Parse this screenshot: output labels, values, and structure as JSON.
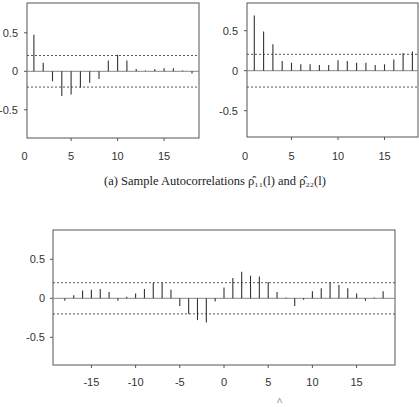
{
  "captions": {
    "a": {
      "prefix": "(a) Sample Autocorrelations ",
      "rho11": "ρ̂₁₁(l)",
      "middle": " and ",
      "rho22": "ρ̂₂₂(l)"
    },
    "b_partial": "^"
  },
  "style": {
    "bar_color": "#333333",
    "frame_color": "#555555",
    "zero_line_color": "#888888",
    "ci_line_color": "#444444"
  },
  "chart_data": [
    {
      "id": "acf11",
      "type": "bar",
      "title": "Sample Autocorrelation rho_11(l)",
      "xlabel": "",
      "ylabel": "",
      "x": [
        1,
        2,
        3,
        4,
        5,
        6,
        7,
        8,
        9,
        10,
        11,
        12,
        13,
        14,
        15,
        16,
        17,
        18
      ],
      "values": [
        0.475,
        0.11,
        -0.13,
        -0.32,
        -0.3,
        -0.21,
        -0.15,
        -0.1,
        0.14,
        0.215,
        0.14,
        0.03,
        0.01,
        0.03,
        0.04,
        0.04,
        0.01,
        -0.03
      ],
      "xticks": [
        0,
        5,
        10,
        15
      ],
      "xtick_labels": [
        "0",
        "5",
        "10",
        "15"
      ],
      "yticks": [
        0.5,
        0,
        -0.5
      ],
      "ytick_labels": [
        "0.5",
        "0",
        "-0.5"
      ],
      "ylim": [
        -0.85,
        0.88
      ],
      "xlim": [
        0.25,
        18.8
      ],
      "confidence_band": 0.205,
      "grid": false
    },
    {
      "id": "acf22",
      "type": "bar",
      "title": "Sample Autocorrelation rho_22(l)",
      "xlabel": "",
      "ylabel": "",
      "x": [
        1,
        2,
        3,
        4,
        5,
        6,
        7,
        8,
        9,
        10,
        11,
        12,
        13,
        14,
        15,
        16,
        17,
        18
      ],
      "values": [
        0.69,
        0.49,
        0.33,
        0.12,
        0.1,
        0.08,
        0.08,
        0.07,
        0.07,
        0.13,
        0.12,
        0.1,
        0.1,
        0.07,
        0.08,
        0.14,
        0.22,
        0.24
      ],
      "xticks": [
        0,
        5,
        10,
        15
      ],
      "xtick_labels": [
        "0",
        "5",
        "10",
        "15"
      ],
      "yticks": [
        0.5,
        0,
        -0.5
      ],
      "ytick_labels": [
        "0.5",
        "0",
        "-0.5"
      ],
      "ylim": [
        -0.85,
        0.88
      ],
      "xlim": [
        0.25,
        18.8
      ],
      "confidence_band": 0.205,
      "grid": false
    },
    {
      "id": "ccf12",
      "type": "bar",
      "title": "Sample Cross-Correlation",
      "xlabel": "",
      "ylabel": "",
      "x": [
        -18,
        -17,
        -16,
        -15,
        -14,
        -13,
        -12,
        -11,
        -10,
        -9,
        -8,
        -7,
        -6,
        -5,
        -4,
        -3,
        -2,
        -1,
        0,
        1,
        2,
        3,
        4,
        5,
        6,
        7,
        8,
        9,
        10,
        11,
        12,
        13,
        14,
        15,
        16,
        17,
        18
      ],
      "values": [
        -0.03,
        0.04,
        0.1,
        0.11,
        0.12,
        0.08,
        -0.03,
        0.02,
        0.06,
        0.12,
        0.2,
        0.2,
        0.11,
        -0.1,
        -0.2,
        -0.28,
        -0.31,
        -0.04,
        0.14,
        0.26,
        0.34,
        0.29,
        0.28,
        0.21,
        0.08,
        0.01,
        -0.1,
        -0.02,
        0.09,
        0.13,
        0.21,
        0.17,
        0.13,
        0.06,
        -0.03,
        0.01,
        0.09
      ],
      "xticks": [
        -15,
        -10,
        -5,
        0,
        5,
        10,
        15
      ],
      "xtick_labels": [
        "-15",
        "-10",
        "-5",
        "0",
        "5",
        "10",
        "15"
      ],
      "yticks": [
        0.5,
        0,
        -0.5
      ],
      "ytick_labels": [
        "0.5",
        "0",
        "-0.5"
      ],
      "ylim": [
        -0.85,
        0.88
      ],
      "xlim": [
        -19.4,
        19.4
      ],
      "confidence_band": 0.2,
      "grid": false
    }
  ]
}
